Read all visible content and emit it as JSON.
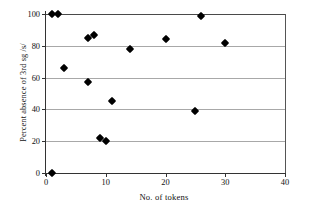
{
  "chart_data": {
    "type": "scatter",
    "title": "",
    "xlabel": "No. of tokens",
    "ylabel": "Percent absence of 3rd sg /s/",
    "xlim": [
      0,
      40
    ],
    "ylim": [
      0,
      100
    ],
    "xticks": [
      0,
      10,
      20,
      30,
      40
    ],
    "yticks": [
      0,
      20,
      40,
      60,
      80,
      100
    ],
    "xtick_labels": [
      "0",
      "10",
      "20",
      "30",
      "40"
    ],
    "ytick_labels": [
      "0",
      "20",
      "40",
      "60",
      "80",
      "100"
    ],
    "grid": "horizontal",
    "legend": "none",
    "marker": "filled-diamond",
    "marker_color": "#000000",
    "grid_color": "#a8a8a8",
    "axis_color": "#333333",
    "background": "#ffffff",
    "points": [
      {
        "x": 1,
        "y": 0
      },
      {
        "x": 1,
        "y": 100
      },
      {
        "x": 2,
        "y": 100
      },
      {
        "x": 3,
        "y": 66
      },
      {
        "x": 7,
        "y": 57
      },
      {
        "x": 7,
        "y": 85
      },
      {
        "x": 8,
        "y": 87
      },
      {
        "x": 9,
        "y": 22
      },
      {
        "x": 10,
        "y": 20
      },
      {
        "x": 11,
        "y": 45
      },
      {
        "x": 14,
        "y": 78
      },
      {
        "x": 20,
        "y": 84
      },
      {
        "x": 25,
        "y": 39
      },
      {
        "x": 26,
        "y": 99
      },
      {
        "x": 30,
        "y": 82
      }
    ]
  }
}
